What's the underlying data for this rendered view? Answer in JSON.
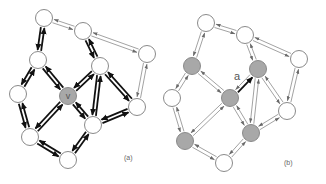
{
  "colors": {
    "node_fill": "#ffffff",
    "highlight_fill": "#a8a8a8",
    "thin_edge": "#7a7a7a",
    "bold_edge": "#111111"
  },
  "panels": [
    {
      "id": "a",
      "caption": "(a)",
      "node_label": "v",
      "labeled_node": "v",
      "highlighted_nodes": [
        "v"
      ],
      "bold_mode": "all-edges-touching-neighbors-of-v"
    },
    {
      "id": "b",
      "caption": "(b)",
      "edge_label": "a",
      "labeled_edge": [
        "v",
        "n5"
      ],
      "highlighted_nodes": [
        "n4",
        "n5",
        "v",
        "n8",
        "n9"
      ],
      "bold_mode": "single-edge"
    }
  ],
  "graph": {
    "nodes": [
      "n1",
      "n2",
      "n3",
      "n4",
      "n5",
      "n6",
      "v",
      "n7",
      "n8",
      "n9",
      "n10"
    ],
    "edges": [
      [
        "n1",
        "n2"
      ],
      [
        "n2",
        "n3"
      ],
      [
        "n1",
        "n4"
      ],
      [
        "n2",
        "n5"
      ],
      [
        "n3",
        "n7"
      ],
      [
        "n4",
        "n6"
      ],
      [
        "n4",
        "v"
      ],
      [
        "n5",
        "v"
      ],
      [
        "n5",
        "n7"
      ],
      [
        "n5",
        "n9"
      ],
      [
        "n6",
        "n8"
      ],
      [
        "v",
        "n8"
      ],
      [
        "v",
        "n9"
      ],
      [
        "n7",
        "n9"
      ],
      [
        "n8",
        "n10"
      ],
      [
        "n9",
        "n10"
      ]
    ],
    "bold_edges_a": [
      [
        "n1",
        "n4"
      ],
      [
        "n4",
        "n6"
      ],
      [
        "n4",
        "v"
      ],
      [
        "n5",
        "v"
      ],
      [
        "n2",
        "n5"
      ],
      [
        "n5",
        "n7"
      ],
      [
        "n5",
        "n9"
      ],
      [
        "v",
        "n8"
      ],
      [
        "v",
        "n9"
      ],
      [
        "n6",
        "n8"
      ],
      [
        "n8",
        "n10"
      ],
      [
        "n9",
        "n10"
      ],
      [
        "n7",
        "n9"
      ]
    ]
  }
}
